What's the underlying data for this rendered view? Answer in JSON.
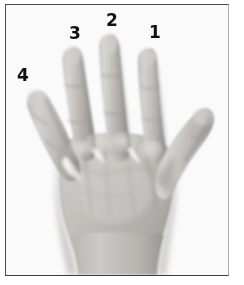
{
  "figure": {
    "kind": "photograph",
    "color_mode": "grayscale",
    "frame": {
      "border_color": "#4a4a4a",
      "background_color": "#fdfdfd"
    },
    "palette": {
      "background": "#ffffff",
      "plate": "#fbfbfb",
      "skin_light": "#d8d6d3",
      "skin_mid": "#b5b2ae",
      "skin_shadow": "#8e8b87",
      "skin_deep_shadow": "#6e6b68",
      "label_color": "#111111"
    },
    "labels": [
      {
        "id": "label-1",
        "text": "1",
        "digit": "index-finger",
        "x": 143,
        "y": 19
      },
      {
        "id": "label-2",
        "text": "2",
        "digit": "middle-finger",
        "x": 100,
        "y": 7
      },
      {
        "id": "label-3",
        "text": "3",
        "digit": "ring-finger",
        "x": 63,
        "y": 20
      },
      {
        "id": "label-4",
        "text": "4",
        "digit": "little-finger",
        "x": 11,
        "y": 62
      }
    ]
  }
}
